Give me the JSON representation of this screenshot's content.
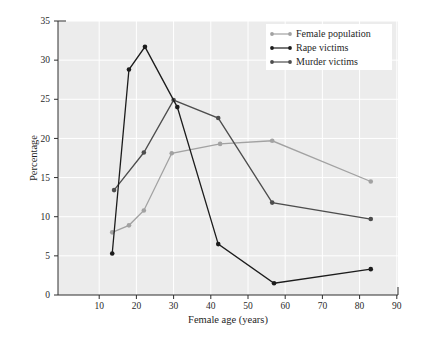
{
  "figure": {
    "background": "#ffffff",
    "plot_bg": "#ececec",
    "grid_color": "#ffffff",
    "axis_color": "#2e2e2e",
    "tick_text_color": "#2a2a2a",
    "legend_bg": "#ffffff"
  },
  "chart_data": {
    "type": "line",
    "title": "",
    "xlabel": "Female age (years)",
    "ylabel": "Percentage",
    "xlim": [
      0,
      90
    ],
    "ylim": [
      0,
      35
    ],
    "xticks": [
      10,
      20,
      30,
      40,
      50,
      60,
      70,
      80,
      90
    ],
    "yticks": [
      0,
      5,
      10,
      15,
      20,
      25,
      30,
      35
    ],
    "grid": true,
    "legend_position": "top-right",
    "series": [
      {
        "name": "Female population",
        "color": "#a2a2a2",
        "points": [
          [
            13.5,
            8.0
          ],
          [
            18,
            8.9
          ],
          [
            22,
            10.8
          ],
          [
            29.5,
            18.1
          ],
          [
            42.5,
            19.3
          ],
          [
            56.5,
            19.7
          ],
          [
            83,
            14.5
          ]
        ]
      },
      {
        "name": "Rape victims",
        "color": "#1c1c1c",
        "points": [
          [
            13.5,
            5.3
          ],
          [
            18,
            28.8
          ],
          [
            22.3,
            31.7
          ],
          [
            31,
            24.0
          ],
          [
            42,
            6.5
          ],
          [
            57,
            1.5
          ],
          [
            83,
            3.3
          ]
        ]
      },
      {
        "name": "Murder victims",
        "color": "#4d4d4d",
        "points": [
          [
            14,
            13.4
          ],
          [
            22,
            18.2
          ],
          [
            30,
            24.9
          ],
          [
            42,
            22.6
          ],
          [
            56.5,
            11.8
          ],
          [
            83,
            9.7
          ]
        ]
      }
    ]
  }
}
